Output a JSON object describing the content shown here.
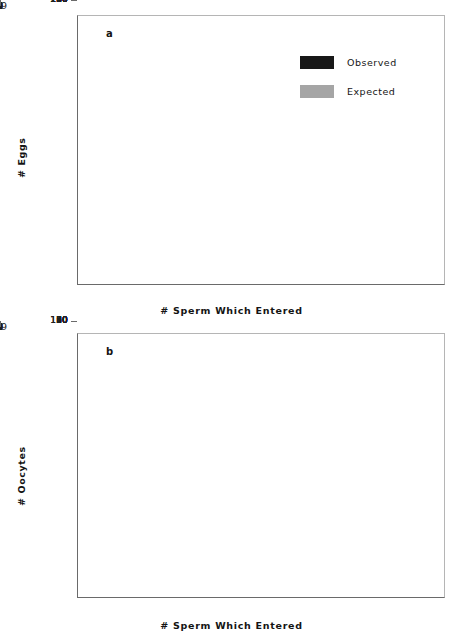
{
  "chart_data": [
    {
      "panel": "a",
      "type": "bar",
      "title": "",
      "xlabel": "# Sperm Which Entered",
      "ylabel": "# Eggs",
      "categories": [
        "0",
        "1",
        "2",
        "3",
        "4",
        "5",
        "6",
        "7",
        "8",
        "9",
        ">9"
      ],
      "yticks": [
        0,
        10,
        20,
        30,
        40,
        50,
        60,
        70,
        80,
        90,
        100,
        110,
        120,
        130,
        140,
        150,
        160,
        170,
        180,
        190,
        200
      ],
      "ylim": [
        0,
        200
      ],
      "grid": false,
      "legend_position": "upper-right",
      "series": [
        {
          "name": "Observed",
          "color": "#181818",
          "values": [
            47,
            191,
            2,
            1,
            3,
            1.5,
            2,
            0,
            0,
            0,
            4
          ]
        },
        {
          "name": "Expected",
          "color": "#9a9a9a",
          "values": [
            94.5,
            100,
            53,
            19,
            6,
            1,
            0.3,
            0,
            0,
            0,
            0
          ]
        }
      ]
    },
    {
      "panel": "b",
      "type": "bar",
      "title": "",
      "xlabel": "# Sperm Which Entered",
      "ylabel": "# Oocytes",
      "categories": [
        "0",
        "1",
        "2",
        "3",
        "4",
        "5",
        "6",
        "7",
        "8",
        "9",
        ">9"
      ],
      "yticks": [
        0,
        10,
        20,
        30,
        40,
        50,
        60,
        70,
        80,
        90,
        100,
        110,
        120
      ],
      "ylim": [
        0,
        120
      ],
      "grid": false,
      "legend_position": "none",
      "series": [
        {
          "name": "Observed",
          "color": "#181818",
          "values": [
            111,
            10,
            4,
            5,
            3,
            4,
            3,
            4,
            5,
            4,
            2
          ]
        },
        {
          "name": "Expected",
          "color": "#9a9a9a",
          "values": [
            14,
            34,
            41,
            33,
            20,
            9.5,
            3.5,
            1,
            0.3,
            0,
            0
          ]
        }
      ]
    }
  ],
  "legend": {
    "entries": [
      {
        "label": "Observed",
        "color": "#181818"
      },
      {
        "label": "Expected",
        "color": "#a5a5a5"
      }
    ]
  },
  "panels": {
    "a": {
      "letter": "a"
    },
    "b": {
      "letter": "b"
    }
  }
}
